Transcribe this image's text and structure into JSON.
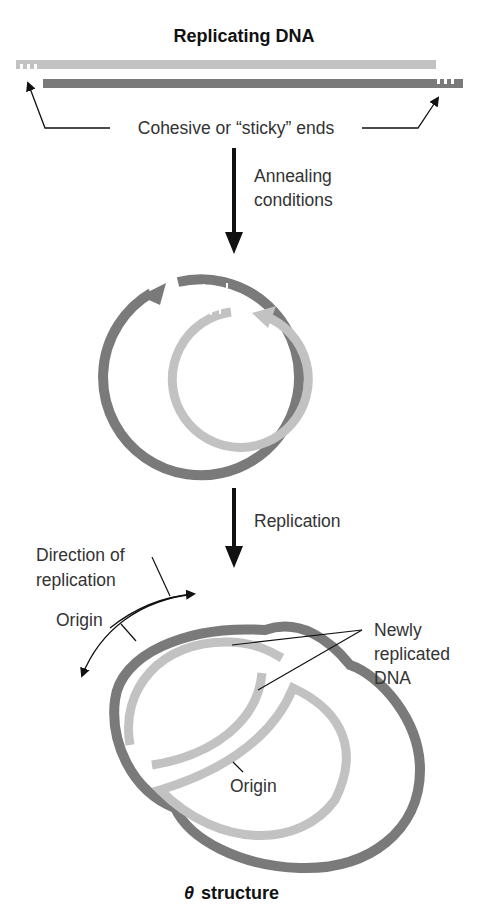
{
  "title": "Replicating DNA",
  "footer": {
    "symbol": "θ",
    "label": "structure"
  },
  "labels": {
    "sticky_ends": "Cohesive or “sticky” ends",
    "annealing_line1": "Annealing",
    "annealing_line2": "conditions",
    "replication": "Replication",
    "direction_line1": "Direction of",
    "direction_line2": "replication",
    "origin_outer": "Origin",
    "origin_inner": "Origin",
    "newly_line1": "Newly",
    "newly_line2": "replicated",
    "newly_line3": "DNA"
  },
  "colors": {
    "dark_strand": "#7a7a7a",
    "light_strand": "#c2c2c2",
    "arrow": "#111111",
    "text": "#333333"
  },
  "steps": [
    {
      "name": "linear-dna",
      "description": "Two linear strands with cohesive ends"
    },
    {
      "name": "annealing",
      "description": "Annealing conditions"
    },
    {
      "name": "circular-dna",
      "description": "Circularized DNA"
    },
    {
      "name": "replication",
      "description": "Replication"
    },
    {
      "name": "theta-structure",
      "description": "θ structure"
    }
  ]
}
